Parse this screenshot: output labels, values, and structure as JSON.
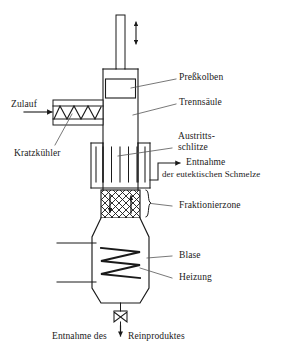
{
  "figure": {
    "type": "process-flow-diagram",
    "language": "de",
    "line_color": "#1a1a1a",
    "text_color": "#1a1a1a",
    "background_color": "#ffffff"
  },
  "labels": {
    "press_piston": "Preßkolben",
    "separation_column": "Trennsäule",
    "exit_slits_line1": "Austritts-",
    "exit_slits_line2": "schlitze",
    "eutectic_draw_line1": "Entnahme",
    "eutectic_draw_line2": "der eutektischen Schmelze",
    "fractionating_zone": "Fraktionierzone",
    "still": "Blase",
    "heating": "Heizung",
    "feed": "Zulauf",
    "scraper_cooler": "Kratzkühler",
    "product_draw_left": "Entnahme des",
    "product_draw_right": "Reinproduktes"
  },
  "flow_arrows": {
    "piston_stroke": "double-headed-vertical-arrow",
    "feed_inlet": "right-arrow",
    "eutectic_outlet": "right-arrow",
    "product_outlet": "down-arrow",
    "fractionation_down": "down-arrow",
    "fractionation_up": "up-arrow"
  },
  "components": {
    "piston_rod": "piston-rod",
    "piston_head": "piston-head-block",
    "column_shell": "column-shell",
    "slits": "vertical-exit-slits",
    "packing": "cross-hatched-packing",
    "heating_coil": "zigzag-heating-coil",
    "cooler_screw": "zigzag-scraper-screw",
    "bottom_valve": "bowtie-valve"
  }
}
